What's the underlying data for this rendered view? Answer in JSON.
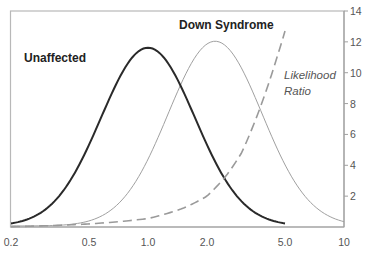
{
  "chart_data": {
    "type": "line",
    "title": "",
    "xlabel": "",
    "ylabel": "",
    "x_scale": "log",
    "x_ticks": [
      0.2,
      0.5,
      1.0,
      2.0,
      5.0,
      10
    ],
    "x_tick_labels": [
      "0.2",
      "0.5",
      "1.0",
      "2.0",
      "5.0",
      "10"
    ],
    "xlim": [
      0.2,
      10
    ],
    "y_right_ticks": [
      2,
      4,
      6,
      8,
      10,
      12,
      14
    ],
    "y_right_tick_labels": [
      "2",
      "4",
      "6",
      "8",
      "10",
      "12",
      "14"
    ],
    "y_right_lim": [
      0,
      14
    ],
    "grid": false,
    "series": [
      {
        "name": "Unaffected",
        "style": "solid-thick-dark",
        "distribution": "log-gaussian",
        "median": 1.0,
        "log10_sd": 0.24,
        "peak_relative_height": 0.83,
        "x_range": [
          0.2,
          5.0
        ],
        "color": "#2a2a2a"
      },
      {
        "name": "Down Syndrome",
        "style": "solid-thin-grey",
        "distribution": "log-gaussian",
        "median": 2.2,
        "log10_sd": 0.24,
        "peak_relative_height": 0.86,
        "x_range": [
          0.2,
          10
        ],
        "color": "#a0a0a0"
      },
      {
        "name": "Likelihood Ratio",
        "style": "dashed-grey",
        "axis": "right",
        "x": [
          0.2,
          0.5,
          1.0,
          1.5,
          2.0,
          2.5,
          3.0,
          3.5,
          4.0,
          4.5,
          5.0
        ],
        "values": [
          0.02,
          0.2,
          0.55,
          1.2,
          2.0,
          3.3,
          4.8,
          6.8,
          8.8,
          10.8,
          12.7
        ],
        "color": "#9a9a9a"
      }
    ],
    "annotations": [
      {
        "text": "Unaffected",
        "style": "bold"
      },
      {
        "text": "Down Syndrome",
        "style": "bold"
      },
      {
        "text": "Likelihood",
        "style": "italic"
      },
      {
        "text": "Ratio",
        "style": "italic"
      }
    ]
  },
  "labels": {
    "unaffected": "Unaffected",
    "down_syndrome": "Down Syndrome",
    "lr_line1": "Likelihood",
    "lr_line2": "Ratio"
  }
}
